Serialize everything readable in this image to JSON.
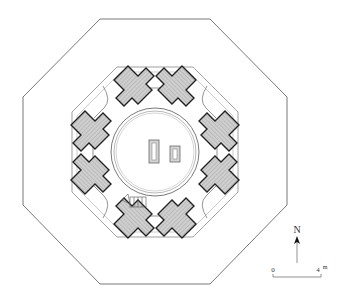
{
  "diagram": {
    "type": "architectural-floor-plan",
    "colors": {
      "line": "#333333",
      "pier_fill": "#c9c9c9",
      "outline": "#555555",
      "background": "#ffffff"
    },
    "north_arrow": {
      "label": "N"
    },
    "scale_bar": {
      "start_label": "0",
      "end_label": "4",
      "unit": "m"
    }
  }
}
